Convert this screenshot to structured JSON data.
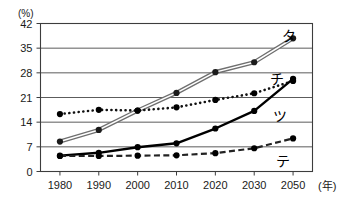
{
  "chart_data": {
    "type": "line",
    "title": "",
    "xlabel": "(年)",
    "ylabel": "(%)",
    "x": [
      1980,
      1990,
      2000,
      2010,
      2020,
      2030,
      2050
    ],
    "categories": [
      "1980",
      "1990",
      "2000",
      "2010",
      "2020",
      "2030",
      "2050"
    ],
    "xlim": [
      1980,
      2050
    ],
    "ylim": [
      0,
      42
    ],
    "yticks": [
      0,
      7,
      14,
      21,
      28,
      35,
      42
    ],
    "ytick_labels": [
      "0",
      "7",
      "14",
      "21",
      "28",
      "35",
      "42"
    ],
    "grid": "horizontal",
    "legend": "inline-labels-at-line-end",
    "series": [
      {
        "name": "タ",
        "label": "タ",
        "style": "double-line-gray-outline",
        "color": "#7a7a7a",
        "marker": "filled-circle",
        "values": [
          8.5,
          11.8,
          17.3,
          22.3,
          28.2,
          31.0,
          37.8
        ],
        "label_position": {
          "x": 289,
          "y": 41
        }
      },
      {
        "name": "チ",
        "label": "チ",
        "style": "dotted",
        "color": "#111111",
        "marker": "filled-circle",
        "values": [
          16.3,
          17.5,
          17.3,
          18.2,
          20.3,
          22.2,
          25.7
        ],
        "label_position": {
          "x": 277,
          "y": 84
        }
      },
      {
        "name": "ツ",
        "label": "ツ",
        "style": "solid-bold",
        "color": "#000000",
        "marker": "filled-circle",
        "values": [
          4.5,
          5.3,
          6.9,
          8.0,
          12.2,
          17.2,
          26.3
        ],
        "label_position": {
          "x": 280,
          "y": 121
        }
      },
      {
        "name": "テ",
        "label": "テ",
        "style": "dashed",
        "color": "#222222",
        "marker": "filled-circle",
        "values": [
          4.4,
          4.4,
          4.5,
          4.6,
          5.2,
          6.6,
          9.4
        ],
        "label_position": {
          "x": 283,
          "y": 166
        }
      }
    ]
  },
  "axes": {
    "y_unit_label": "(%)",
    "x_unit_label": "(年)"
  }
}
